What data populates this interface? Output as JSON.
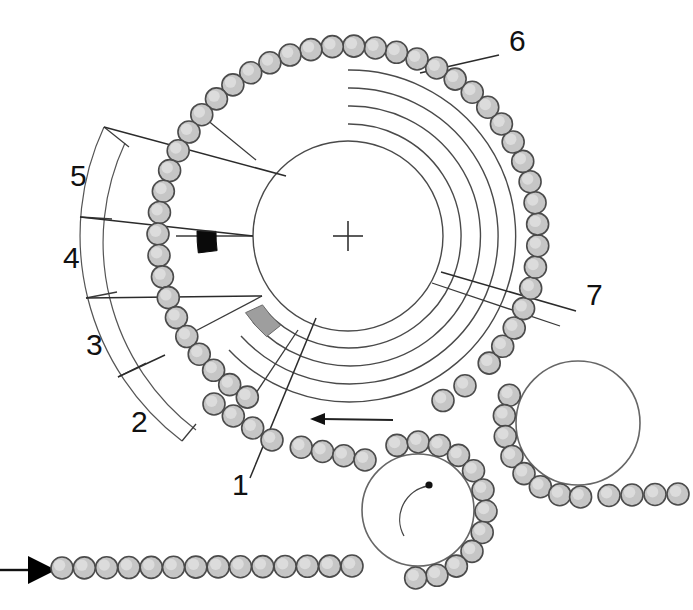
{
  "figure": {
    "background_color": "#ffffff",
    "width": 693,
    "height": 610
  },
  "colors": {
    "bead_fill": "#c6c6c6",
    "bead_stroke": "#4b4b4b",
    "line": "#4a4a4a",
    "segment_black": "#0a0a0a",
    "segment_gray": "#9e9e9e",
    "label": "#111111"
  },
  "labels": [
    {
      "id": "1",
      "text": "1",
      "x": 232,
      "y": 495
    },
    {
      "id": "2",
      "text": "2",
      "x": 131,
      "y": 432
    },
    {
      "id": "3",
      "text": "3",
      "x": 86,
      "y": 355
    },
    {
      "id": "4",
      "text": "4",
      "x": 63,
      "y": 268
    },
    {
      "id": "5",
      "text": "5",
      "x": 70,
      "y": 186
    },
    {
      "id": "6",
      "text": "6",
      "x": 509,
      "y": 51
    },
    {
      "id": "7",
      "text": "7",
      "x": 586,
      "y": 305
    }
  ],
  "main_track": {
    "center_x": 348,
    "center_y": 236,
    "arc_count": 5,
    "arc_radii": [
      95,
      112,
      130,
      148,
      166
    ],
    "hub_radius": 95,
    "center_cross_size": 15
  },
  "segments": [
    {
      "name": "black-sector-segment",
      "color": "#0a0a0a",
      "inner_radius": 131,
      "outer_radius": 150,
      "start_angle": 172,
      "end_angle": 186
    },
    {
      "name": "gray-sector-segment",
      "color": "#9e9e9e",
      "inner_radius": 112,
      "outer_radius": 131,
      "start_angle": 127,
      "end_angle": 142
    }
  ],
  "idlers": [
    {
      "name": "lower-left-idler",
      "cx": 418,
      "cy": 510,
      "r": 56,
      "has_rotation_mark": true
    },
    {
      "name": "right-idler",
      "cx": 578,
      "cy": 423,
      "r": 62,
      "has_rotation_mark": false
    }
  ],
  "arrows": {
    "feed_arrow": {
      "name": "feed-direction-arrow",
      "x1": 2,
      "y1": 570,
      "x2": 48,
      "y2": 570,
      "direction": "right"
    },
    "rotation_arrow": {
      "name": "track-rotation-arrow",
      "direction": "counter-clockwise",
      "x_start": 392,
      "x_end": 312,
      "y": 419
    },
    "idler_rotation_arrow": {
      "name": "idler-rotation-arrow",
      "direction": "clockwise"
    }
  },
  "dimension_arcs": {
    "name": "angular-sector-dimensions",
    "inner_radius": 236,
    "outer_radius": 258,
    "sector_boundaries_deg": [
      138,
      156,
      174,
      192,
      210
    ]
  },
  "bead_chain": {
    "name": "bead-chain",
    "bead_radius": 11,
    "bead_spacing": 21.5,
    "description": "Continuous chain of spherical beads wrapping the main track and two idlers and extending to the bottom-left feed line"
  }
}
